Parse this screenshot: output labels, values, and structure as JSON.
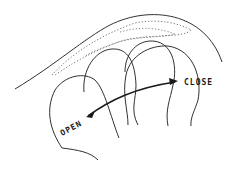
{
  "diagram": {
    "labels": {
      "close": "CLOSE",
      "open": "OPEN"
    },
    "colors": {
      "line": "#1a1a1a",
      "background": "#ffffff"
    }
  }
}
